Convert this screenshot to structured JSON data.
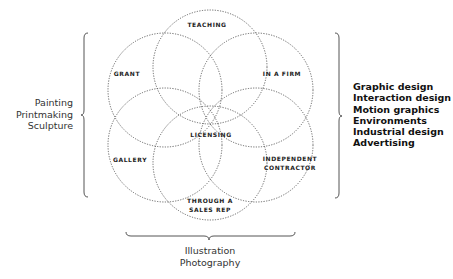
{
  "diagram": {
    "circles": [
      {
        "id": "teaching",
        "label": "TEACHING",
        "cx": 210,
        "cy": 67,
        "r": 57,
        "label_x": 207,
        "label_y": 24
      },
      {
        "id": "grant",
        "label": "GRANT",
        "cx": 165,
        "cy": 90,
        "r": 57,
        "label_x": 127,
        "label_y": 73
      },
      {
        "id": "in-a-firm",
        "label": "IN A FIRM",
        "cx": 256,
        "cy": 90,
        "r": 57,
        "label_x": 282,
        "label_y": 73
      },
      {
        "id": "gallery",
        "label": "GALLERY",
        "cx": 165,
        "cy": 145,
        "r": 57,
        "label_x": 130,
        "label_y": 159
      },
      {
        "id": "independent-contractor",
        "label": "INDEPENDENT\nCONTRACTOR",
        "cx": 256,
        "cy": 145,
        "r": 57,
        "label_x": 290,
        "label_y": 163
      },
      {
        "id": "through-a-sales-rep",
        "label": "THROUGH A\nSALES REP",
        "cx": 210,
        "cy": 163,
        "r": 57,
        "label_x": 210,
        "label_y": 205
      }
    ],
    "center_label": "LICENSING",
    "center_label_pos": {
      "x": 211,
      "y": 134
    },
    "groups": {
      "left": [
        "Painting",
        "Printmaking",
        "Sculpture"
      ],
      "right": [
        "Graphic design",
        "Interaction design",
        "Motion graphics",
        "Environments",
        "Industrial design",
        "Advertising"
      ],
      "bottom": [
        "Illustration",
        "Photography"
      ]
    },
    "colors": {
      "circle_stroke": "#555555",
      "label_text": "#222222",
      "background": "#ffffff"
    }
  },
  "labels": {
    "teaching": "TEACHING",
    "grant": "GRANT",
    "in_a_firm": "IN A FIRM",
    "gallery": "GALLERY",
    "independent_line1": "INDEPENDENT",
    "independent_line2": "CONTRACTOR",
    "sales_line1": "THROUGH A",
    "sales_line2": "SALES REP",
    "licensing": "LICENSING"
  },
  "left_group": {
    "l0": "Painting",
    "l1": "Printmaking",
    "l2": "Sculpture"
  },
  "right_group": {
    "l0": "Graphic design",
    "l1": "Interaction design",
    "l2": "Motion graphics",
    "l3": "Environments",
    "l4": "Industrial design",
    "l5": "Advertising"
  },
  "bottom_group": {
    "l0": "Illustration",
    "l1": "Photography"
  }
}
